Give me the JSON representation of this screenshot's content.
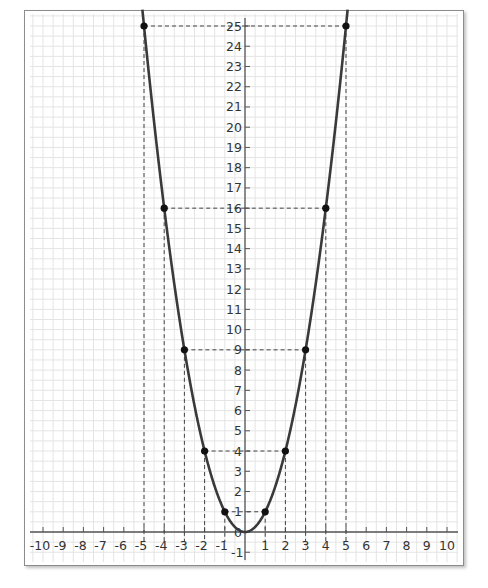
{
  "chart_data": {
    "type": "line",
    "title": "",
    "function": "y = x^2",
    "xlabel": "",
    "ylabel": "",
    "xlim": [
      -10,
      10
    ],
    "ylim": [
      -1,
      25
    ],
    "grid": true,
    "x_tick_labels": [
      "-10",
      "-9",
      "-8",
      "-7",
      "-6",
      "-5",
      "-4",
      "-3",
      "-2",
      "-1",
      "1",
      "2",
      "3",
      "4",
      "5",
      "6",
      "7",
      "8",
      "9",
      "10"
    ],
    "y_tick_labels": [
      "-1",
      "0",
      "1",
      "2",
      "3",
      "4",
      "5",
      "6",
      "7",
      "8",
      "9",
      "10",
      "11",
      "12",
      "13",
      "14",
      "15",
      "16",
      "17",
      "18",
      "19",
      "20",
      "21",
      "22",
      "23",
      "24",
      "25"
    ],
    "series": [
      {
        "name": "y = x^2",
        "x": [
          -5,
          -4,
          -3,
          -2,
          -1,
          0,
          1,
          2,
          3,
          4,
          5
        ],
        "y": [
          25,
          16,
          9,
          4,
          1,
          0,
          1,
          4,
          9,
          16,
          25
        ]
      }
    ],
    "marked_points": [
      {
        "x": -5,
        "y": 25
      },
      {
        "x": -4,
        "y": 16
      },
      {
        "x": -3,
        "y": 9
      },
      {
        "x": -2,
        "y": 4
      },
      {
        "x": -1,
        "y": 1
      },
      {
        "x": 1,
        "y": 1
      },
      {
        "x": 2,
        "y": 4
      },
      {
        "x": 3,
        "y": 9
      },
      {
        "x": 4,
        "y": 16
      },
      {
        "x": 5,
        "y": 25
      }
    ],
    "guide_lines": "dashed lines from each marked point to x-axis and y-axis",
    "legend": null
  },
  "colors": {
    "curve": "#3a3a3a",
    "grid": "#e4e4e4",
    "axis": "#555555",
    "dash": "#444444",
    "point": "#111111",
    "frame": "#8c8c8c"
  }
}
